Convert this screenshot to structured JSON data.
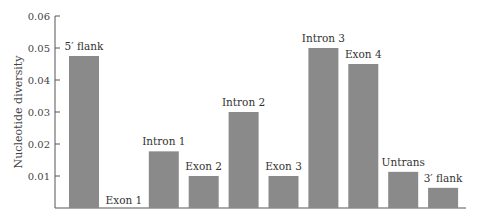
{
  "chart_data": {
    "type": "bar",
    "title": "",
    "xlabel": "",
    "ylabel": "Nucleotide diversity",
    "ylim": [
      0,
      0.06
    ],
    "yticks": [
      "0.01",
      "0.02",
      "0.03",
      "0.04",
      "0.05",
      "0.06"
    ],
    "grid": false,
    "legend": null,
    "bar_color": "#8a8a8a",
    "categories": [
      "5′ flank",
      "Exon 1",
      "Intron 1",
      "Exon 2",
      "Intron 2",
      "Exon 3",
      "Intron 3",
      "Exon 4",
      "Untrans",
      "3′ flank"
    ],
    "values": [
      0.0475,
      0.0,
      0.0177,
      0.01,
      0.03,
      0.01,
      0.05,
      0.045,
      0.0113,
      0.0063
    ]
  }
}
